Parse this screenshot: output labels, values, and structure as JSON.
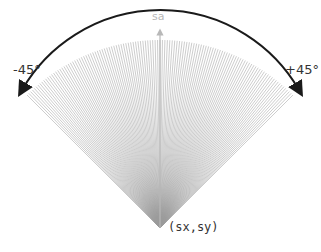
{
  "diagram": {
    "axis_label": "sa",
    "left_angle_label": "-45°",
    "right_angle_label": "+45°",
    "origin_label": "(sx,sy)",
    "fan": {
      "min_angle_deg": -45,
      "max_angle_deg": 45,
      "ray_count": 121,
      "ray_color": "#9a9a9a",
      "arc_color": "#1a1a1a",
      "center_axis_color": "#b8b8b8"
    }
  }
}
